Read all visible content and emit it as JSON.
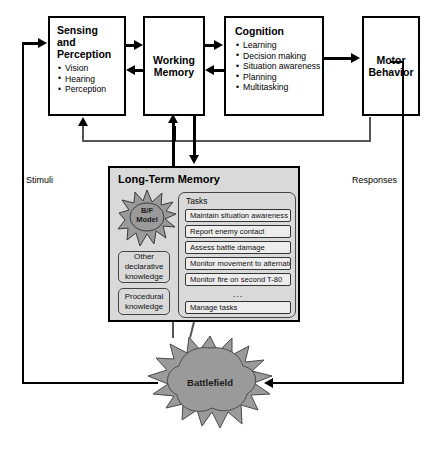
{
  "diagram": {
    "outer_labels": {
      "left": "Stimuli",
      "right": "Responses"
    },
    "boxes": {
      "sensing": {
        "title_lines": [
          "Sensing",
          "and",
          "Perception"
        ],
        "bullets": [
          "Vision",
          "Hearing",
          "Perception"
        ]
      },
      "working_memory": {
        "title_lines": [
          "Working",
          "Memory"
        ],
        "bullets": []
      },
      "cognition": {
        "title_lines": [
          "Cognition"
        ],
        "bullets": [
          "Learning",
          "Decision making",
          "Situation awareness",
          "Planning",
          "Multitasking"
        ]
      },
      "motor": {
        "title_lines": [
          "Motor",
          "Behavior"
        ],
        "bullets": []
      }
    },
    "long_term_memory": {
      "title": "Long-Term Memory",
      "model_burst": {
        "label_lines": [
          "B/F",
          "Model"
        ]
      },
      "knowledge_boxes": [
        {
          "label_lines": [
            "Other",
            "declarative",
            "knowledge"
          ]
        },
        {
          "label_lines": [
            "Procedural",
            "knowledge"
          ]
        }
      ],
      "tasks_panel": {
        "label": "Tasks",
        "items": [
          "Maintain situation awareness",
          "Report enemy contact",
          "Assess battle damage",
          "Monitor movement to alternate",
          "Monitor fire on second T-80"
        ],
        "ellipsis": "...",
        "footer_item": "Manage tasks"
      }
    },
    "battlefield": {
      "label": "Battlefield"
    },
    "colors": {
      "line": "#000000",
      "bus_line": "#555555",
      "panel_fill": "#d9d9d9",
      "task_fill": "#ededed",
      "burst_fill": "#9a9a9a",
      "background": "#ffffff"
    }
  }
}
